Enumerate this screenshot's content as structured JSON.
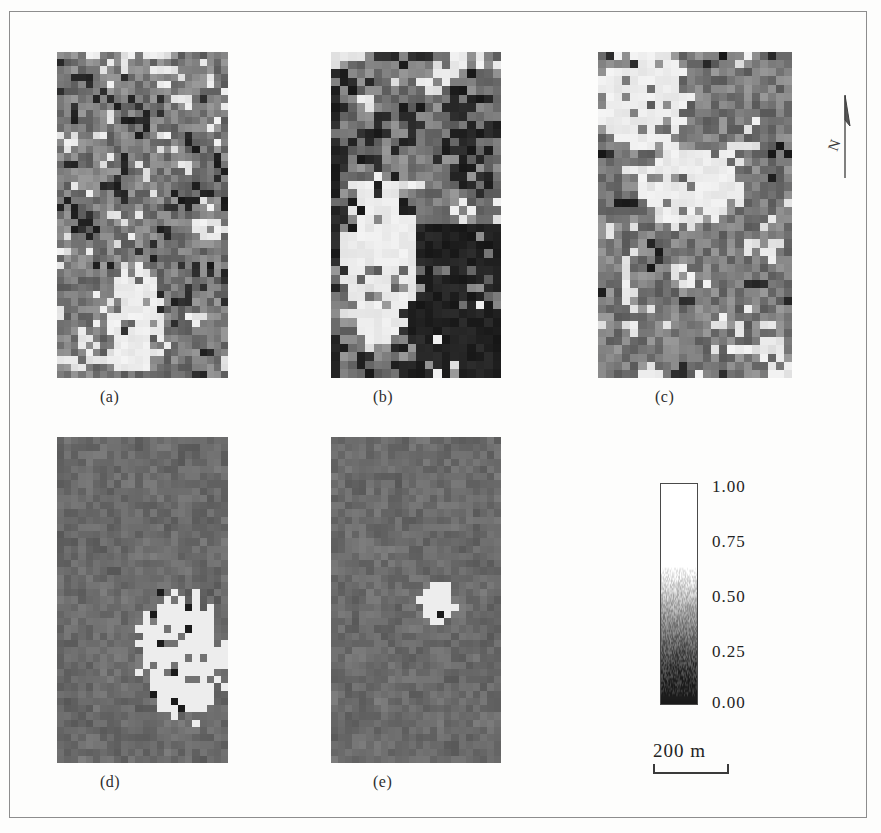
{
  "figure": {
    "background_color": "#fdfdfc",
    "frame_color": "#8d8d8d",
    "width": 881,
    "height": 833
  },
  "panels": [
    {
      "id": "a",
      "label": "(a)",
      "x": 57,
      "y": 52,
      "w": 171,
      "h": 326,
      "label_x": 100,
      "label_y": 388,
      "description": "high-variance binary-like raster, scattered white / mid-gray / black cells, bright white patch lower-centre-left",
      "cell_px": 7.2,
      "base_gray": 0.36,
      "noise": 0.72,
      "seed": 1101,
      "bright_blob": {
        "cx": 0.44,
        "cy": 0.8,
        "rx": 0.16,
        "ry": 0.17,
        "strength": 0.95
      }
    },
    {
      "id": "b",
      "label": "(b)",
      "x": 331,
      "y": 52,
      "w": 170,
      "h": 326,
      "label_x": 373,
      "label_y": 388,
      "description": "coarser raster, large dark block occupying lower-right quadrant, whiter left and mid-upper zones",
      "cell_px": 8.6,
      "base_gray": 0.46,
      "noise": 0.7,
      "seed": 2202,
      "dark_block": {
        "x0": 0.5,
        "y0": 0.52,
        "x1": 1.0,
        "y1": 1.0,
        "strength": 0.88
      },
      "bright_blob": {
        "cx": 0.26,
        "cy": 0.62,
        "rx": 0.22,
        "ry": 0.26,
        "strength": 0.7
      }
    },
    {
      "id": "c",
      "label": "(c)",
      "x": 598,
      "y": 52,
      "w": 194,
      "h": 326,
      "label_x": 655,
      "label_y": 388,
      "description": "mostly dark raster, white upper-left corner and a white band through the middle",
      "cell_px": 8.2,
      "base_gray": 0.26,
      "noise": 0.66,
      "seed": 3303,
      "bright_blob": {
        "cx": 0.22,
        "cy": 0.12,
        "rx": 0.24,
        "ry": 0.16,
        "strength": 0.92
      },
      "bright_blob2": {
        "cx": 0.46,
        "cy": 0.4,
        "rx": 0.26,
        "ry": 0.12,
        "strength": 0.85
      }
    },
    {
      "id": "d",
      "label": "(d)",
      "x": 57,
      "y": 437,
      "w": 171,
      "h": 326,
      "label_x": 100,
      "label_y": 773,
      "description": "near-uniform mid-gray field with one irregular white cluster in the lower-right, containing a few dark cells",
      "cell_px": 7.2,
      "base_gray": 0.42,
      "noise": 0.06,
      "seed": 4404,
      "white_cluster": {
        "cx": 0.7,
        "cy": 0.66,
        "rx": 0.24,
        "ry": 0.19,
        "strength": 1.0,
        "ragged": 0.45
      }
    },
    {
      "id": "e",
      "label": "(e)",
      "x": 331,
      "y": 437,
      "w": 170,
      "h": 326,
      "label_x": 373,
      "label_y": 773,
      "description": "near-uniform mid-gray field with a single small diagonal white blob slightly right of centre",
      "cell_px": 7.2,
      "base_gray": 0.42,
      "noise": 0.055,
      "seed": 5505,
      "white_cluster": {
        "cx": 0.61,
        "cy": 0.49,
        "rx": 0.105,
        "ry": 0.065,
        "strength": 1.0,
        "ragged": 0.22
      }
    }
  ],
  "colorbar": {
    "orientation": "vertical",
    "min": 0.0,
    "max": 1.0,
    "min_label": "0.00",
    "max_label": "1.00",
    "ramp": "grayscale black-to-white (low to high)",
    "black_hex": "#1a1a1a",
    "white_hex": "#ffffff",
    "ticks": [
      {
        "value": 1.0,
        "label": "1.00",
        "pos_pct": 0
      },
      {
        "value": 0.75,
        "label": "0.75",
        "pos_pct": 25
      },
      {
        "value": 0.5,
        "label": "0.50",
        "pos_pct": 50
      },
      {
        "value": 0.25,
        "label": "0.25",
        "pos_pct": 75
      },
      {
        "value": 0.0,
        "label": "0.00",
        "pos_pct": 100
      }
    ]
  },
  "scalebar": {
    "label": "200 m",
    "length_value": 200,
    "unit": "m"
  },
  "north_arrow": {
    "label": "N",
    "icon": "north-arrow-icon"
  },
  "chart_data": {
    "type": "heatmap",
    "title": "",
    "subtitle": "",
    "panels": [
      "(a)",
      "(b)",
      "(c)",
      "(d)",
      "(e)"
    ],
    "colorbar_label": "",
    "colorbar_ticks": [
      "0.00",
      "0.25",
      "0.50",
      "0.75",
      "1.00"
    ],
    "colorbar_range": [
      0.0,
      1.0
    ],
    "colormap": "gray",
    "scalebar": "200 m",
    "legend_position": "right",
    "grid": false,
    "panel_summaries": [
      {
        "panel": "(a)",
        "mean_value": 0.36,
        "spatial_variance": "very high",
        "pattern": "fine-grained salt-and-pepper, bright patch lower-left-centre"
      },
      {
        "panel": "(b)",
        "mean_value": 0.46,
        "spatial_variance": "high",
        "pattern": "coarser clumping, large low-value block lower-right"
      },
      {
        "panel": "(c)",
        "mean_value": 0.26,
        "spatial_variance": "high",
        "pattern": "predominantly low values, high-value zones upper-left and mid-band"
      },
      {
        "panel": "(d)",
        "mean_value": 0.42,
        "spatial_variance": "very low",
        "pattern": "uniform background, single high-value cluster lower-right"
      },
      {
        "panel": "(e)",
        "mean_value": 0.42,
        "spatial_variance": "very low",
        "pattern": "uniform background, single small high-value blob near centre"
      }
    ]
  }
}
